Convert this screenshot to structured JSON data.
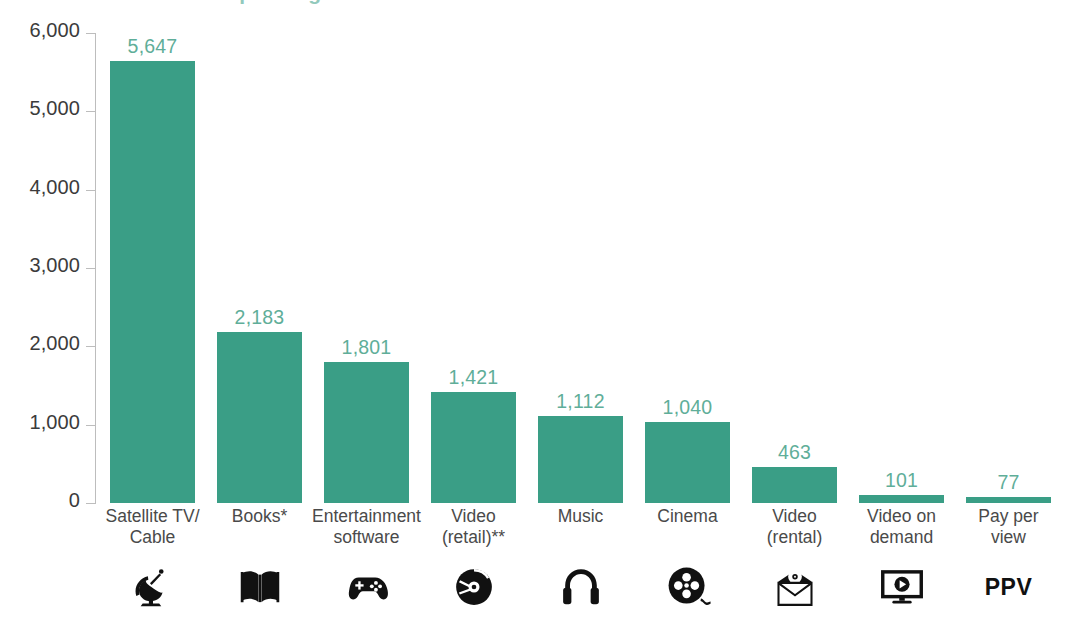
{
  "chart_data": {
    "type": "bar",
    "title": "Consumer spending on home entertainment",
    "title_clipped": true,
    "xlabel": "",
    "ylabel": "",
    "ylim": [
      0,
      6000
    ],
    "yticks": [
      0,
      1000,
      2000,
      3000,
      4000,
      5000,
      6000
    ],
    "ytick_labels": [
      "0",
      "1,000",
      "2,000",
      "3,000",
      "4,000",
      "5,000",
      "6,000"
    ],
    "grid": false,
    "legend": "none",
    "bar_color": "#3a9e86",
    "value_label_color": "#5fae99",
    "axis_color": "#bdbdbd",
    "categories": [
      "Satellite TV/\nCable",
      "Books*",
      "Entertainment\nsoftware",
      "Video\n(retail)**",
      "Music",
      "Cinema",
      "Video\n(rental)",
      "Video on\ndemand",
      "Pay per\nview"
    ],
    "values": [
      5647,
      2183,
      1801,
      1421,
      1112,
      1040,
      463,
      101,
      77
    ],
    "value_labels": [
      "5,647",
      "2,183",
      "1,801",
      "1,421",
      "1,112",
      "1,040",
      "463",
      "101",
      "77"
    ],
    "icons": [
      "satellite-dish-icon",
      "open-book-icon",
      "game-controller-icon",
      "compact-disc-icon",
      "headphones-icon",
      "film-reel-icon",
      "disc-in-envelope-icon",
      "tv-play-icon",
      "ppv-text-icon"
    ],
    "icon_labels": [
      "",
      "",
      "",
      "",
      "",
      "",
      "",
      "",
      "PPV"
    ]
  }
}
